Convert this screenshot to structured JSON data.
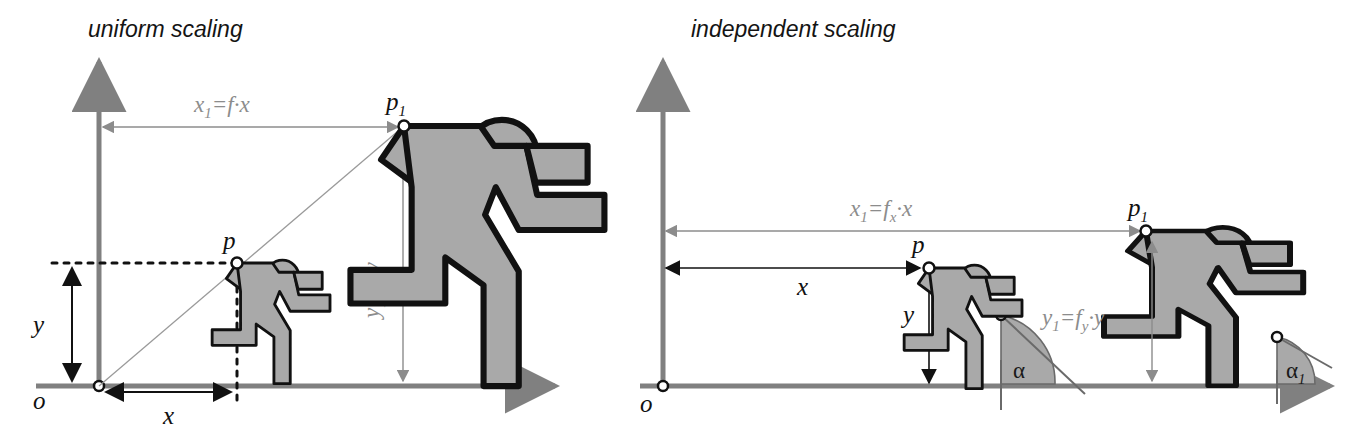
{
  "figure": {
    "background_color": "#ffffff",
    "body_fill_color": "#a9a9a9",
    "body_stroke_color": "#111111",
    "axis_color": "#808080",
    "gray_label_color": "#8c8c8c",
    "black_label_color": "#111111",
    "angle_wedge_color": "#a9a9a9"
  },
  "panels": [
    {
      "id": "uniform",
      "title": "uniform scaling",
      "origin_label": "o",
      "labels": {
        "x": "x",
        "y": "y",
        "p": "p",
        "p1_base": "p",
        "p1_sub": "1",
        "x1_expr_base": "x",
        "x1_expr_sub": "1",
        "x1_expr_rest": "=f·x",
        "y1_expr_base": "y",
        "y1_expr_sub": "1",
        "y1_expr_rest": "=f·y"
      },
      "figures": [
        {
          "name": "small-runner",
          "scale": "1"
        },
        {
          "name": "large-runner",
          "scale": "f"
        }
      ]
    },
    {
      "id": "independent",
      "title": "independent scaling",
      "origin_label": "o",
      "labels": {
        "x": "x",
        "y": "y",
        "p1_base": "p",
        "p1_sub": "1",
        "p_base": "p",
        "alpha": "α",
        "alpha1_base": "α",
        "alpha1_sub": "1",
        "x1_expr_base": "x",
        "x1_expr_sub": "1",
        "x1_expr_eq": "=f",
        "x1_expr_f_sub": "x",
        "x1_expr_rest": "·x",
        "y1_expr_base": "y",
        "y1_expr_sub": "1",
        "y1_expr_eq": "=f",
        "y1_expr_f_sub": "y",
        "y1_expr_rest": "·y"
      },
      "figures": [
        {
          "name": "small-runner",
          "scale": "1"
        },
        {
          "name": "large-runner-stretched",
          "scale": "fx,fy"
        }
      ]
    }
  ]
}
